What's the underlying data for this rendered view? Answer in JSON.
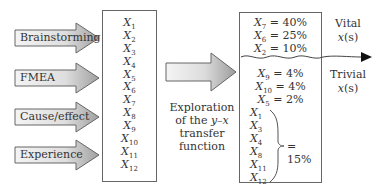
{
  "sources": [
    {
      "label": "Brainstorming",
      "top": 22
    },
    {
      "label": "FMEA",
      "top": 62
    },
    {
      "label": "Cause/effect",
      "top": 101
    },
    {
      "label": "Experience",
      "top": 139
    }
  ],
  "candidate_box": {
    "items": [
      {
        "var": "X",
        "sub": "1"
      },
      {
        "var": "X",
        "sub": "2"
      },
      {
        "var": "X",
        "sub": "3"
      },
      {
        "var": "X",
        "sub": "4"
      },
      {
        "var": "X",
        "sub": "5"
      },
      {
        "var": "X",
        "sub": "6"
      },
      {
        "var": "X",
        "sub": "7"
      },
      {
        "var": "X",
        "sub": "8"
      },
      {
        "var": "X",
        "sub": "9"
      },
      {
        "var": "X",
        "sub": "10"
      },
      {
        "var": "X",
        "sub": "11"
      },
      {
        "var": "X",
        "sub": "12"
      }
    ]
  },
  "exploration": {
    "line1": "Exploration",
    "line2a": "of the ",
    "line2b": "y–x",
    "line3": "transfer",
    "line4": "function"
  },
  "result_box": {
    "vital": [
      {
        "var": "X",
        "sub": "7",
        "value": " = 40%"
      },
      {
        "var": "X",
        "sub": "6",
        "value": " = 25%"
      },
      {
        "var": "X",
        "sub": "2",
        "value": " = 10%"
      }
    ],
    "trivial": [
      {
        "var": "X",
        "sub": "9",
        "value": " = 4%"
      },
      {
        "var": "X",
        "sub": "10",
        "value": " = 4%"
      },
      {
        "var": "X",
        "sub": "5",
        "value": " = 2%"
      }
    ],
    "group": [
      {
        "var": "X",
        "sub": "1"
      },
      {
        "var": "X",
        "sub": "3"
      },
      {
        "var": "X",
        "sub": "4"
      },
      {
        "var": "X",
        "sub": "8"
      },
      {
        "var": "X",
        "sub": "11"
      },
      {
        "var": "X",
        "sub": "12"
      }
    ],
    "group_total": "= 15%"
  },
  "side_labels": {
    "vital_word": "Vital",
    "trivial_word": "Trivial",
    "xs_var": "x",
    "xs_suffix": "(s)"
  },
  "colors": {
    "arrow_fill_light": "#f2f2f2",
    "arrow_fill_dark": "#a8a8a8",
    "outline": "#666666"
  }
}
